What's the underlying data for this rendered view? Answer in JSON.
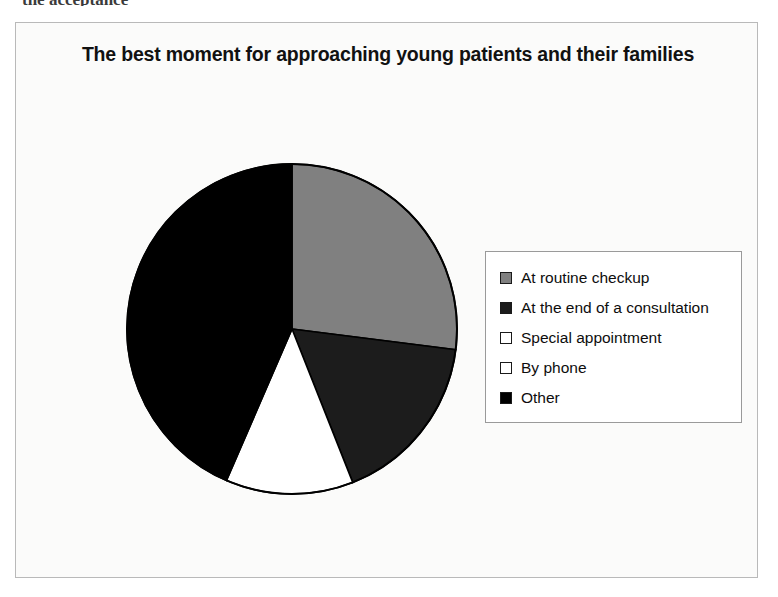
{
  "page": {
    "top_fragment": "the acceptance"
  },
  "chart_frame": {
    "background": "#fbfbfa",
    "border_color": "#b9b9b9"
  },
  "legend": {
    "position": "right",
    "border_color": "#9a9a9a",
    "items": [
      {
        "label": "At routine checkup",
        "color": "#808080"
      },
      {
        "label": "At the end of a consultation",
        "color": "#1c1c1c"
      },
      {
        "label": "Special appointment",
        "color": "#ffffff"
      },
      {
        "label": "By phone",
        "color": "#ffffff"
      },
      {
        "label": "Other",
        "color": "#000000"
      }
    ]
  },
  "chart_data": {
    "type": "pie",
    "title": "The best moment for approaching young patients and their families",
    "subtitle": "",
    "xlabel": "",
    "ylabel": "",
    "legend_position": "right",
    "grid": false,
    "start_angle_deg": 0,
    "direction": "clockwise",
    "categories": [
      "At routine checkup",
      "At the end of a consultation",
      "Special appointment",
      "By phone",
      "Other"
    ],
    "values": [
      27,
      17,
      12.5,
      0,
      43.5
    ],
    "unit": "%",
    "colors": [
      "#808080",
      "#1c1c1c",
      "#ffffff",
      "#ffffff",
      "#000000"
    ],
    "slice_outline_color": "#000000",
    "slices": [
      {
        "label": "At routine checkup",
        "value": 27,
        "color": "#808080",
        "start_deg": 0,
        "end_deg": 97.2
      },
      {
        "label": "At the end of a consultation",
        "value": 17,
        "color": "#1c1c1c",
        "start_deg": 97.2,
        "end_deg": 158.4
      },
      {
        "label": "Special appointment",
        "value": 12.5,
        "color": "#ffffff",
        "start_deg": 158.4,
        "end_deg": 203.4
      },
      {
        "label": "By phone",
        "value": 0,
        "color": "#ffffff",
        "start_deg": 203.4,
        "end_deg": 203.4
      },
      {
        "label": "Other",
        "value": 43.5,
        "color": "#000000",
        "start_deg": 203.4,
        "end_deg": 360
      }
    ]
  }
}
